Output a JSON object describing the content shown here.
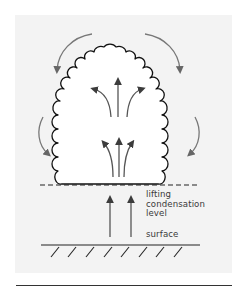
{
  "diagram": {
    "colors": {
      "panel_background": "#f3f3f3",
      "cloud_outline": "#111111",
      "cloud_fill": "#ffffff",
      "updraft_arrows": "#444444",
      "downdraft_arrows": "#6e6e6e",
      "ground_line": "#222222",
      "text": "#3a3a3a"
    },
    "labels": {
      "lifting_condensation_level": [
        "lifting",
        "condensation",
        "level"
      ],
      "surface": "surface"
    },
    "elements": {
      "cloud": "cumulus-cloud-outline",
      "lcl_line": "dashed-line",
      "surface_line": "solid-line-with-hatching",
      "hatch_count": 8,
      "arrows": {
        "surface_updrafts": 2,
        "lower_cloud_updrafts": 3,
        "upper_cloud_divergent_updrafts": 3,
        "outer_top_downdrafts": 2,
        "outer_side_downdrafts": 2
      }
    }
  }
}
